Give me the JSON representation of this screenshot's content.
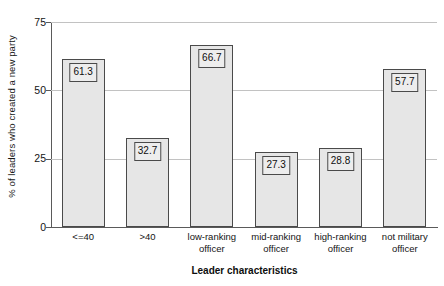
{
  "chart_data": {
    "type": "bar",
    "title": "",
    "subtitle": "",
    "xlabel": "Leader characteristics",
    "ylabel": "% of leaders who created a new party",
    "categories": [
      "<=40",
      ">40",
      "low-ranking officer",
      "mid-ranking officer",
      "high-ranking officer",
      "not military officer"
    ],
    "values": [
      61.3,
      32.7,
      66.7,
      27.3,
      28.8,
      57.7
    ],
    "value_labels": [
      "61.3",
      "32.7",
      "66.7",
      "27.3",
      "28.8",
      "57.7"
    ],
    "ylim": [
      0,
      75
    ],
    "yticks": [
      0,
      25,
      50,
      75
    ],
    "ytick_labels": [
      "0",
      "25",
      "50",
      "75"
    ],
    "grid": true,
    "grid_axis": "y",
    "legend": false,
    "legend_position": "none",
    "bar_fill_color": "#e6e6e6",
    "bar_edge_color": "#4a4a4a",
    "grid_color": "#c2c2c2",
    "axis_color": "#5a5a5a",
    "background_color": "#ffffff",
    "text_color": "#141414"
  },
  "axes": {
    "y_title": "% of leaders who created a new party",
    "x_title": "Leader characteristics"
  }
}
